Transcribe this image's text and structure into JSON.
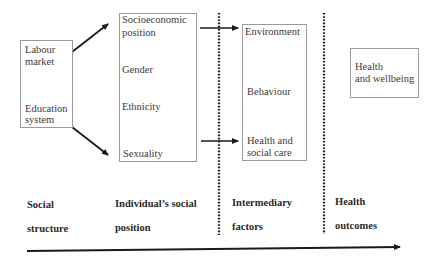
{
  "diagram": {
    "social_structure_box": {
      "items": [
        "Labour",
        "market",
        "Education",
        "system"
      ]
    },
    "individual_position_box": {
      "items": [
        "Socioeconomic",
        "position",
        "Gender",
        "Ethnicity",
        "Sexuality"
      ]
    },
    "intermediary_box": {
      "items": [
        "Environment",
        "Behaviour",
        "Health and",
        "social care"
      ]
    },
    "outcome_box": {
      "items": [
        "Health",
        "and wellbeing"
      ]
    },
    "column_labels": [
      {
        "line1": "Social",
        "line2": "structure"
      },
      {
        "line1": "Individual’s social",
        "line2": "position"
      },
      {
        "line1": "Intermediary",
        "line2": "factors"
      },
      {
        "line1": "Health",
        "line2": "outcomes"
      }
    ],
    "colors": {
      "box_border": "#9a9a9a",
      "arrow": "#1a1a1a",
      "text": "#3a3a3a"
    }
  }
}
